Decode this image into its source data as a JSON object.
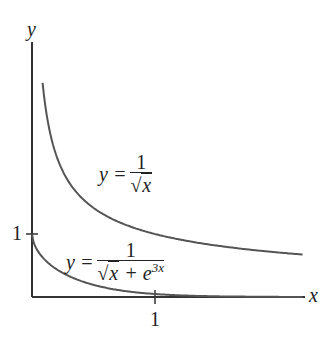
{
  "chart_data": {
    "type": "line",
    "title": "",
    "xlabel": "x",
    "ylabel": "y",
    "x_ticks": [
      "1"
    ],
    "y_ticks": [
      "1"
    ],
    "xlim": [
      0,
      2.2
    ],
    "ylim": [
      0,
      4.6
    ],
    "grid": false,
    "legend": "none (inline curve labels)",
    "series": [
      {
        "name": "y = 1/√x",
        "label_parts": {
          "lhs": "y =",
          "num": "1",
          "den": "x"
        },
        "x": [
          0.1,
          0.15,
          0.2,
          0.3,
          0.4,
          0.5,
          0.75,
          1.0,
          1.25,
          1.5,
          1.75,
          2.0,
          2.2
        ],
        "values": [
          3.16,
          2.58,
          2.24,
          1.83,
          1.58,
          1.41,
          1.15,
          1.0,
          0.89,
          0.82,
          0.76,
          0.71,
          0.67
        ]
      },
      {
        "name": "y = 1/(√x + e^{3x})",
        "label_parts": {
          "lhs": "y =",
          "num": "1",
          "den_a": "x",
          "den_plus": "+ e",
          "den_exp": "3x"
        },
        "x": [
          0,
          0.05,
          0.1,
          0.2,
          0.3,
          0.4,
          0.5,
          0.75,
          1.0,
          1.5,
          2.0,
          2.2
        ],
        "values": [
          1.0,
          0.73,
          0.61,
          0.45,
          0.34,
          0.26,
          0.2,
          0.095,
          0.047,
          0.011,
          0.0025,
          0.0014
        ]
      }
    ]
  },
  "axes": {
    "x_label": "x",
    "y_label": "y",
    "x_tick_label": "1",
    "y_tick_label": "1"
  },
  "colors": {
    "curve": "#555555",
    "axis": "#333333",
    "text": "#222222"
  }
}
